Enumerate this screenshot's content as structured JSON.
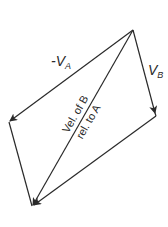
{
  "diagram": {
    "type": "vector-parallelogram",
    "colors": {
      "line": "#2a2a2a",
      "background": "#ffffff"
    },
    "vertices": {
      "apex": [
        133,
        30
      ],
      "vb_end": [
        156,
        116
      ],
      "neg_va_end": [
        9,
        122
      ],
      "bottom": [
        32,
        207
      ]
    },
    "labels": {
      "neg_va": {
        "prefix": "-V",
        "sub": "A"
      },
      "vb": {
        "prefix": "V",
        "sub": "B"
      },
      "diagonal_line1": "Vel. of B",
      "diagonal_line2": "rel. to A"
    },
    "vectors": [
      {
        "name": "-V_A",
        "from": "apex",
        "to": "neg_va_end"
      },
      {
        "name": "V_B",
        "from": "apex",
        "to": "vb_end"
      },
      {
        "name": "Vel. of B rel. to A",
        "from": "apex",
        "to": "bottom"
      },
      {
        "name": "V_B (translated)",
        "from": "neg_va_end",
        "to": "bottom"
      },
      {
        "name": "-V_A (translated)",
        "from": "vb_end",
        "to": "bottom"
      }
    ]
  }
}
